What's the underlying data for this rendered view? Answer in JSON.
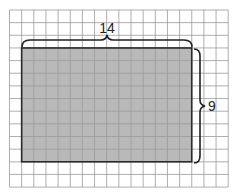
{
  "diagram": {
    "type": "area-model-grid",
    "grid": {
      "columns": 18,
      "rows": 14,
      "line_color": "#9a9a9a",
      "background": "#ffffff"
    },
    "rectangle": {
      "width_units": 14,
      "height_units": 9,
      "fill": "#b9b9b9",
      "stroke": "#2a2a2a"
    },
    "labels": {
      "width": "14",
      "height": "9"
    }
  }
}
